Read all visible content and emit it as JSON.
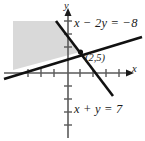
{
  "figure": {
    "background_color": "#ffffff",
    "shade_color": "#d9d9d9",
    "line_color": "#111111",
    "axis_color": "#555555"
  },
  "labels": {
    "line1": "x − 2y = −8",
    "line2": "x + y = 7",
    "point": "(2,5)",
    "axis_x": "x",
    "axis_y": "y"
  },
  "chart_data": {
    "type": "line",
    "title": "",
    "xlabel": "x",
    "ylabel": "y",
    "xlim": [
      -4.2,
      4.8
    ],
    "ylim": [
      -4.8,
      4.2
    ],
    "grid": false,
    "legend": "none",
    "axes": {
      "x_axis_pixel_y": 73,
      "y_axis_pixel_x": 68,
      "tick_spacing_px": 13,
      "x_ticks_px": [
        28,
        41,
        54,
        80,
        93,
        106,
        119
      ],
      "y_ticks_px": [
        21,
        34,
        47,
        86,
        99,
        112,
        125
      ],
      "x_arrow_end_px": 129,
      "y_arrow_end_px": 10
    },
    "series": [
      {
        "name": "x − 2y = −8",
        "equation": "x - 2y = -8",
        "slope": 0.5,
        "intercept": 4,
        "pixel_start": [
          4,
          79
        ],
        "pixel_end": [
          142,
          37
        ],
        "label_text": "x − 2y = −8"
      },
      {
        "name": "x + y = 7",
        "equation": "x + y = 7",
        "slope": -1,
        "intercept": 7,
        "pixel_start": [
          56,
          21
        ],
        "pixel_end": [
          113,
          96
        ],
        "label_text": "x + y = 7"
      }
    ],
    "annotations": [
      {
        "text": "(2,5)",
        "point_pixel": [
          80,
          52
        ],
        "label_pixel": [
          85,
          53
        ],
        "marker": "filled-dot"
      }
    ],
    "shaded_region": {
      "description": "Solution region shaded light gray, bounded above-right by x + y = 7 and below by x − 2y = −8",
      "fill": "#d9d9d9",
      "polygon_pixels": [
        [
          13,
          21
        ],
        [
          56,
          21
        ],
        [
          80,
          52
        ],
        [
          13,
          70
        ]
      ]
    }
  }
}
